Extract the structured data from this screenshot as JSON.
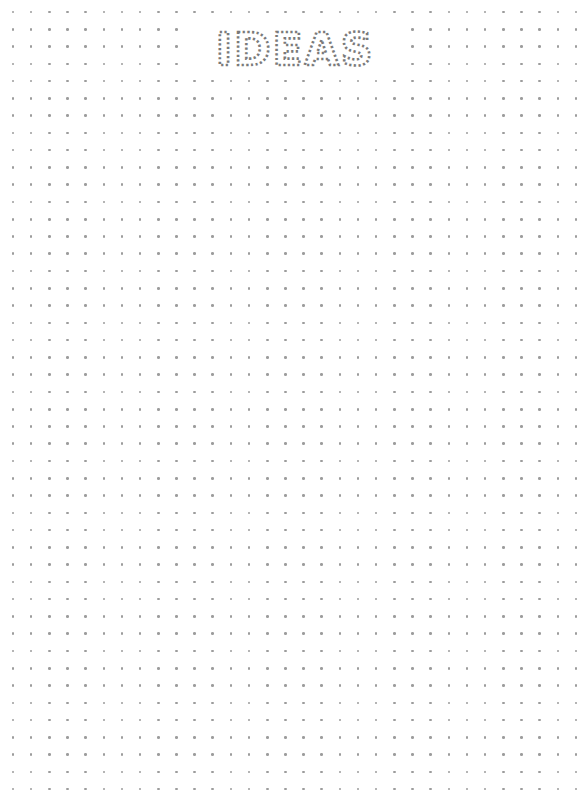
{
  "page": {
    "type": "dot-grid notebook page",
    "background_color": "#ffffff",
    "dot_color": "#9c9c9c"
  },
  "title": {
    "text": "IDEAS",
    "color": "#7a7a7a",
    "style": "letters formed from tiny dotted glyphs"
  },
  "grid": {
    "columns": 32,
    "rows": 46,
    "origin_x": 13,
    "origin_y": 12,
    "spacing_x": 18.16,
    "spacing_y": 17.27,
    "cleared_area": {
      "x": 186,
      "y": 21,
      "width": 218,
      "height": 55
    }
  }
}
